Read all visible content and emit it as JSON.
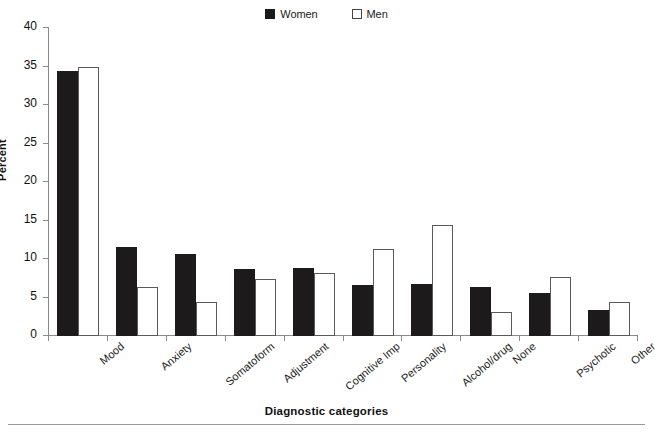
{
  "chart_data": {
    "type": "bar",
    "title": "",
    "xlabel": "Diagnostic categories",
    "ylabel": "Percent",
    "ylim": [
      0,
      40
    ],
    "ytick_step": 5,
    "yticks": [
      0,
      5,
      10,
      15,
      20,
      25,
      30,
      35,
      40
    ],
    "grid": false,
    "legend_position": "top-center",
    "categories": [
      "Mood",
      "Anxiety",
      "Somatoform",
      "Adjustment",
      "Cognitive Imp",
      "Personality",
      "Alcohol/drug",
      "None",
      "Psychotic",
      "Other"
    ],
    "series": [
      {
        "name": "Women",
        "color": "#1c1a1a",
        "style": "filled",
        "values": [
          34.4,
          11.6,
          10.6,
          8.7,
          8.8,
          6.6,
          6.7,
          6.4,
          5.6,
          3.4
        ]
      },
      {
        "name": "Men",
        "color": "#ffffff",
        "style": "hollow",
        "values": [
          35.0,
          6.4,
          4.4,
          7.4,
          8.2,
          11.3,
          14.4,
          3.1,
          7.7,
          4.4
        ]
      }
    ]
  },
  "legend": {
    "entries": [
      {
        "label": "Women",
        "swatch": "filled-square-icon"
      },
      {
        "label": "Men",
        "swatch": "hollow-square-icon"
      }
    ]
  },
  "axes": {
    "y_title": "Percent",
    "x_title": "Diagnostic categories"
  }
}
